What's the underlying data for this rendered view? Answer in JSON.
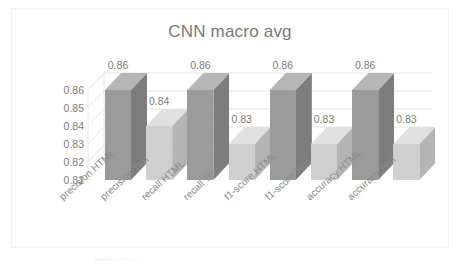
{
  "chart_data": {
    "type": "bar",
    "title": "CNN macro avg",
    "xlabel": "",
    "ylabel": "",
    "categories": [
      "precision HTML",
      "precision Text",
      "recall HTML",
      "recall Text",
      "f1-score HTML",
      "f1-score Text",
      "accuracy HTML",
      "accuracy Text"
    ],
    "values": [
      0.86,
      0.84,
      0.86,
      0.83,
      0.86,
      0.83,
      0.86,
      0.83
    ],
    "data_labels": [
      "0.86",
      "0.84",
      "0.86",
      "0.83",
      "0.86",
      "0.83",
      "0.86",
      "0.83"
    ],
    "ylim": [
      0.81,
      0.865
    ],
    "yticks": [
      0.86,
      0.85,
      0.84,
      0.83,
      0.82,
      0.81
    ],
    "ytick_labels": [
      "0.86",
      "0.85",
      "0.84",
      "0.83",
      "0.82",
      "0.81"
    ],
    "grid": true,
    "legend": "none",
    "style": "3d-column",
    "bar_colors": [
      "#9b9b9b",
      "#cfcfcf",
      "#9b9b9b",
      "#cfcfcf",
      "#9b9b9b",
      "#cfcfcf",
      "#9b9b9b",
      "#cfcfcf"
    ],
    "bar_top_colors": [
      "#b6b6b6",
      "#e0e0e0",
      "#b6b6b6",
      "#e0e0e0",
      "#b6b6b6",
      "#e0e0e0",
      "#b6b6b6",
      "#e0e0e0"
    ],
    "bar_side_colors": [
      "#7d7d7d",
      "#b4b4b4",
      "#7d7d7d",
      "#b4b4b4",
      "#7d7d7d",
      "#b4b4b4",
      "#7d7d7d",
      "#b4b4b4"
    ]
  },
  "colors": {
    "background": "#ffffff",
    "frame_border": "#f2f2f2",
    "title_text": "#7a7a7a",
    "tick_text": "#7d7d7d",
    "xtick_text": "#8a8a8a",
    "gridline": "#e3e3e3"
  }
}
